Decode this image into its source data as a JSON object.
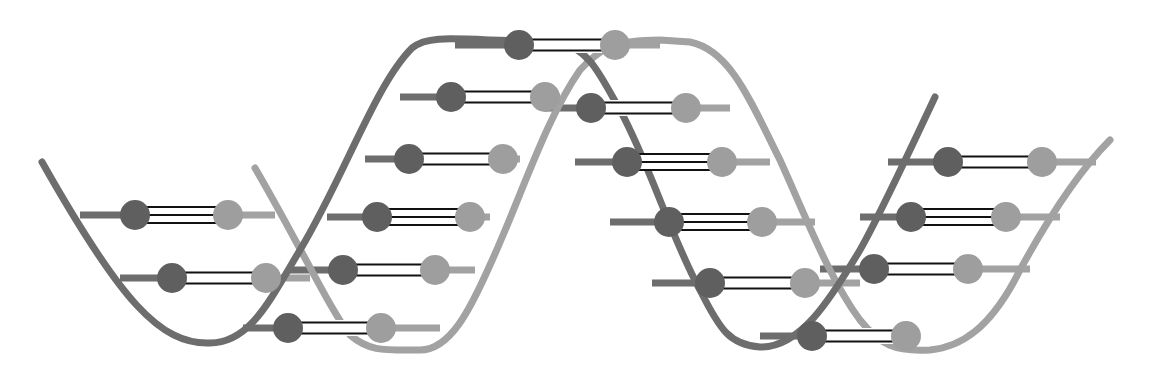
{
  "diagram": {
    "title": "DNA double helix",
    "type": "dna-double-helix",
    "colors": {
      "background": "#ffffff",
      "strand_a": "#6d6d6d",
      "strand_b": "#a2a2a2",
      "nucleotide_a": "#5f5f5f",
      "nucleotide_b": "#9e9e9e",
      "hydrogen_bond": "#111111"
    },
    "strand_a_path": "M42,162 C120,300 160,345 210,343 C250,343 270,300 300,250 C345,175 375,85 412,48 C425,37 445,38 490,40 L560,42 C590,50 600,75 620,110 C650,165 670,235 700,290 C720,330 730,345 760,347 C800,348 830,300 860,250 C880,215 910,150 935,97",
    "strand_b_path": "M255,168 C300,245 330,310 350,335 C370,352 385,350 420,350 C450,350 470,310 490,265 C520,200 545,120 580,70 C600,48 615,40 660,40 L690,42 C730,50 750,100 780,160 C805,215 830,280 860,320 C880,345 895,352 930,350 C960,347 990,330 1020,270 C1050,215 1080,170 1110,140",
    "base_pairs": [
      {
        "y": 215,
        "x1": 80,
        "x2": 275,
        "a": 135,
        "b": 228,
        "bonds": 3
      },
      {
        "y": 278,
        "x1": 120,
        "x2": 310,
        "a": 172,
        "b": 266,
        "bonds": 2
      },
      {
        "y": 328,
        "x1": 243,
        "x2": 440,
        "a": 288,
        "b": 381,
        "bonds": 2
      },
      {
        "y": 270,
        "x1": 290,
        "x2": 475,
        "a": 343,
        "b": 435,
        "bonds": 2
      },
      {
        "y": 217,
        "x1": 327,
        "x2": 490,
        "a": 377,
        "b": 470,
        "bonds": 3
      },
      {
        "y": 159,
        "x1": 365,
        "x2": 520,
        "a": 409,
        "b": 503,
        "bonds": 2
      },
      {
        "y": 97,
        "x1": 400,
        "x2": 560,
        "a": 451,
        "b": 545,
        "bonds": 2
      },
      {
        "y": 45,
        "x1": 455,
        "x2": 660,
        "a": 519,
        "b": 615,
        "bonds": 2
      },
      {
        "y": 108,
        "x1": 545,
        "x2": 730,
        "a": 591,
        "b": 686,
        "bonds": 2
      },
      {
        "y": 162,
        "x1": 575,
        "x2": 770,
        "a": 627,
        "b": 722,
        "bonds": 3
      },
      {
        "y": 222,
        "x1": 610,
        "x2": 815,
        "a": 669,
        "b": 762,
        "bonds": 3
      },
      {
        "y": 283,
        "x1": 652,
        "x2": 860,
        "a": 710,
        "b": 805,
        "bonds": 2
      },
      {
        "y": 336,
        "x1": 760,
        "x2": 910,
        "a": 812,
        "b": 906,
        "bonds": 2
      },
      {
        "y": 269,
        "x1": 820,
        "x2": 1030,
        "a": 874,
        "b": 968,
        "bonds": 2
      },
      {
        "y": 217,
        "x1": 860,
        "x2": 1060,
        "a": 911,
        "b": 1006,
        "bonds": 3
      },
      {
        "y": 162,
        "x1": 888,
        "x2": 1096,
        "a": 948,
        "b": 1042,
        "bonds": 2
      }
    ]
  }
}
